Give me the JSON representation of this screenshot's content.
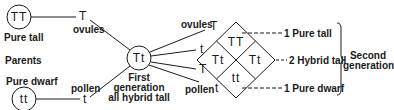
{
  "parents": {
    "label": "Parents",
    "tall": {
      "genotype": "TT",
      "label": "Pure tall"
    },
    "dwarf": {
      "genotype": "tt",
      "label": "Pure dwarf"
    },
    "ovules": {
      "label": "ovules",
      "allele": "T"
    },
    "pollen": {
      "label": "pollen",
      "allele": "t"
    }
  },
  "first_generation": {
    "genotype": "Tt",
    "label_line1": "First",
    "label_line2": "generation",
    "label_line3": "all hybrid tall"
  },
  "gametes": {
    "ovules_label": "ovules",
    "ovule_alleles": [
      "T",
      "t"
    ],
    "pollen_label": "pollen",
    "pollen_alleles": [
      "T",
      "t"
    ]
  },
  "punnett": {
    "top": "TT",
    "left": "Tt",
    "right": "Tt",
    "bottom": "tt"
  },
  "results": {
    "pure_tall": "1 Pure tall",
    "hybrid_tall": "2 Hybrid tall",
    "pure_dwarf": "1 Pure dwarf",
    "group_line1": "Second",
    "group_line2": "generation"
  }
}
